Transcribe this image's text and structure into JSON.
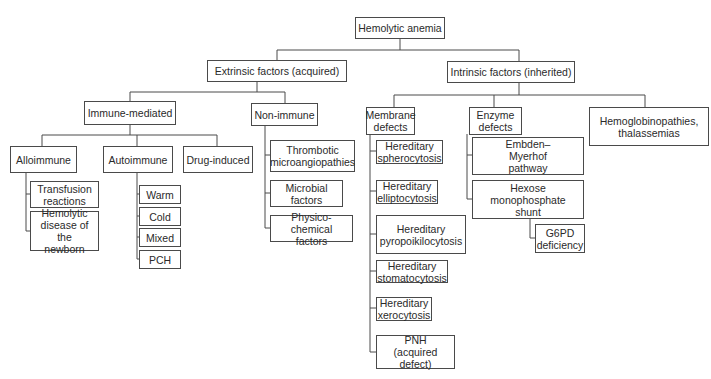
{
  "title": "Hemolytic anemia",
  "extrinsic": {
    "label": "Extrinsic factors (acquired)",
    "immune_mediated": {
      "label": "Immune-mediated",
      "alloimmune": {
        "label": "Alloimmune",
        "children": [
          "Transfusion\nreactions",
          "Hemolytic\ndisease of the\nnewborn"
        ]
      },
      "autoimmune": {
        "label": "Autoimmune",
        "children": [
          "Warm",
          "Cold",
          "Mixed",
          "PCH"
        ]
      },
      "drug_induced": {
        "label": "Drug-induced"
      }
    },
    "non_immune": {
      "label": "Non-immune",
      "children": [
        "Thrombotic\nmicroangiopathies",
        "Microbial\nfactors",
        "Physico-chemical\nfactors"
      ]
    }
  },
  "intrinsic": {
    "label": "Intrinsic factors (inherited)",
    "membrane": {
      "label": "Membrane\ndefects",
      "children": [
        "Hereditary\nspherocytosis",
        "Hereditary\nelliptocytosis",
        "Hereditary\npyropoikilocytosis",
        "Hereditary\nstomatocytosis",
        "Hereditary\nxerocytosis",
        "PNH\n(acquired defect)"
      ]
    },
    "enzyme": {
      "label": "Enzyme\ndefects",
      "children": [
        "Embden–\nMyerhof\npathway",
        "Hexose\nmonophosphate\nshunt"
      ],
      "hexose_children": [
        "G6PD\ndeficiency"
      ]
    },
    "hemoglobinopathies": {
      "label": "Hemoglobinopathies,\nthalassemias"
    }
  }
}
